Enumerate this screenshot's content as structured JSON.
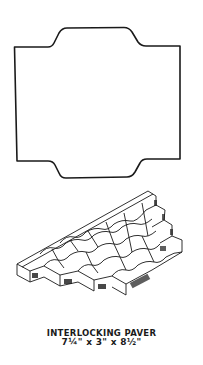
{
  "figure": {
    "top_view": {
      "description": "paver-outline-plan-view"
    },
    "iso_view": {
      "description": "interlocking-pavers-isometric-view"
    }
  },
  "caption": {
    "title": "INTERLOCKING PAVER",
    "dimensions": "7¼\" x 3\" x 8½\""
  },
  "colors": {
    "ink": "#1a1a1a",
    "background": "#ffffff"
  }
}
